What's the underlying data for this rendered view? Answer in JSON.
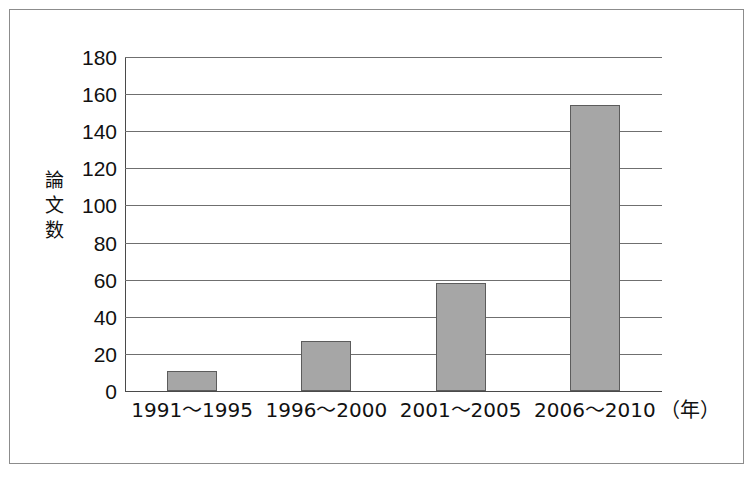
{
  "chart_data": {
    "type": "bar",
    "title": "",
    "subtitle": "",
    "xlabel": "",
    "ylabel": "論文数",
    "x_unit_label": "（年）",
    "categories": [
      "1991〜1995",
      "1996〜2000",
      "2001〜2005",
      "2006〜2010"
    ],
    "values": [
      11,
      27,
      58,
      154
    ],
    "ylim": [
      0,
      180
    ],
    "ytick_step": 20,
    "yticks": [
      0,
      20,
      40,
      60,
      80,
      100,
      120,
      140,
      160,
      180
    ],
    "ytick_labels": [
      "0",
      "20",
      "40",
      "60",
      "80",
      "100",
      "120",
      "140",
      "160",
      "180"
    ],
    "grid": true,
    "grid_axis": "y",
    "legend": false,
    "legend_position": "none",
    "bar_fill_color": "#a6a6a6",
    "bar_edge_color": "#5c5c5c",
    "grid_color": "#6f6f6f",
    "axis_color": "#4a4a4a",
    "frame_color": "#8c8c8c",
    "background_color": "#ffffff",
    "text_color": "#111111"
  }
}
